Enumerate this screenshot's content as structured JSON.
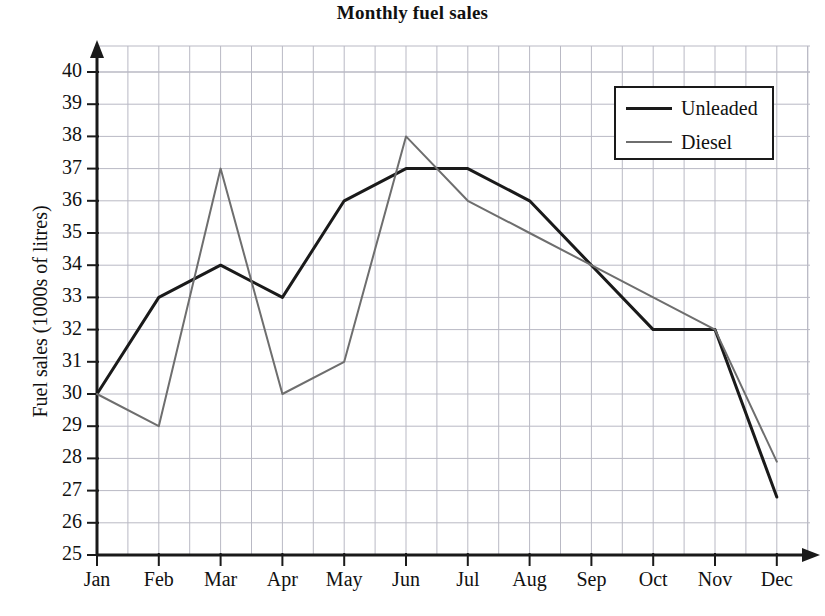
{
  "chart_data": {
    "type": "line",
    "title": "Monthly fuel sales",
    "xlabel": "",
    "ylabel": "Fuel sales (1000s of litres)",
    "categories": [
      "Jan",
      "Feb",
      "Mar",
      "Apr",
      "May",
      "Jun",
      "Jul",
      "Aug",
      "Sep",
      "Oct",
      "Nov",
      "Dec"
    ],
    "ylim": [
      25,
      40
    ],
    "y_ticks": [
      25,
      26,
      27,
      28,
      29,
      30,
      31,
      32,
      33,
      34,
      35,
      36,
      37,
      38,
      39,
      40
    ],
    "grid": true,
    "grid_minor_x": true,
    "legend_position": "top-right",
    "series": [
      {
        "name": "Unleaded",
        "color": "#1a1a1a",
        "width": 3,
        "values": [
          30,
          33,
          34,
          33,
          36,
          37,
          37,
          36,
          34,
          32,
          32,
          26.8
        ]
      },
      {
        "name": "Diesel",
        "color": "#6e6e6e",
        "width": 2,
        "values": [
          30,
          29,
          37,
          30,
          31,
          38,
          36,
          35,
          34,
          33,
          32,
          27.9
        ]
      }
    ]
  },
  "axes": {
    "y_tick_labels": [
      "40",
      "39",
      "38",
      "37",
      "36",
      "35",
      "34",
      "33",
      "32",
      "31",
      "30",
      "29",
      "28",
      "27",
      "26",
      "25"
    ],
    "x_tick_labels": [
      "Jan",
      "Feb",
      "Mar",
      "Apr",
      "May",
      "Jun",
      "Jul",
      "Aug",
      "Sep",
      "Oct",
      "Nov",
      "Dec"
    ]
  },
  "legend": {
    "items": [
      {
        "label": "Unleaded"
      },
      {
        "label": "Diesel"
      }
    ]
  },
  "colors": {
    "unleaded": "#1a1a1a",
    "diesel": "#6e6e6e",
    "grid": "#b9b9c4",
    "axis": "#1a1a1a",
    "background": "#ffffff"
  }
}
